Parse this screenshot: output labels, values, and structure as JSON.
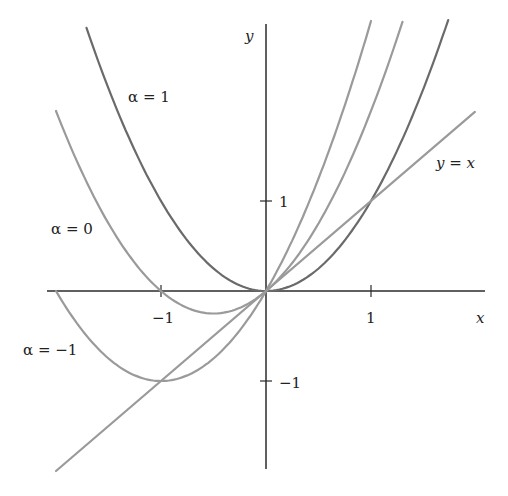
{
  "figure": {
    "axes": {
      "x_label": "x",
      "y_label": "y",
      "x_ticks": [
        {
          "value": -1,
          "label": "−1"
        },
        {
          "value": 1,
          "label": "1"
        }
      ],
      "y_ticks": [
        {
          "value": 1,
          "label": "1"
        },
        {
          "value": -1,
          "label": "−1"
        }
      ],
      "x_range": [
        -2.1,
        2.05
      ],
      "y_range": [
        -2.0,
        2.95
      ]
    },
    "labels": {
      "alpha_1": "α = 1",
      "alpha_0": "α = 0",
      "alpha_neg1": "α = −1",
      "line": "y = x"
    },
    "colors": {
      "axis": "#2b2b2b",
      "alpha_1_curve": "#6a6a6a",
      "other_curves": "#9a9a9a",
      "text": "#222222"
    }
  },
  "chart_data": {
    "type": "line",
    "title": "",
    "xlabel": "x",
    "ylabel": "y",
    "xlim": [
      -2.1,
      2.05
    ],
    "ylim": [
      -2.0,
      2.95
    ],
    "grid": false,
    "series": [
      {
        "name": "α = 1",
        "formula": "y = x^2",
        "x": [
          -1.71,
          -1,
          -0.5,
          0,
          0.5,
          1,
          1.73
        ],
        "values": [
          2.92,
          1,
          0.25,
          0,
          0.25,
          1,
          3.0
        ]
      },
      {
        "name": "α = 0",
        "formula": "y = x^2 + x",
        "x": [
          -2,
          -1,
          -0.5,
          0,
          0.5,
          1,
          1.3
        ],
        "values": [
          2,
          0,
          -0.25,
          0,
          0.75,
          2,
          2.99
        ]
      },
      {
        "name": "α = −1",
        "formula": "y = x^2 + 2x",
        "x": [
          -2,
          -1,
          0,
          0.5,
          1.0
        ],
        "values": [
          0,
          -1,
          0,
          1.25,
          3.0
        ]
      },
      {
        "name": "y = x",
        "formula": "y = x",
        "x": [
          -2,
          2
        ],
        "values": [
          -2,
          2
        ]
      }
    ],
    "annotations": [
      "α = 1",
      "α = 0",
      "α = −1",
      "y = x"
    ]
  }
}
